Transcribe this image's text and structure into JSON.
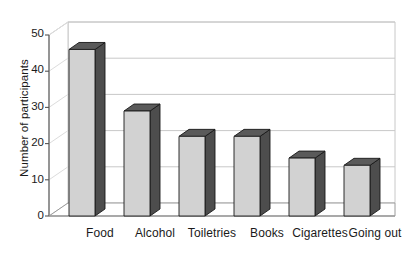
{
  "chart_data": {
    "type": "bar",
    "title": "",
    "title_note": "chart title cropped off at top edge of screenshot, illegible",
    "categories": [
      "Food",
      "Alcohol",
      "Toiletries",
      "Books",
      "Cigarettes",
      "Going out"
    ],
    "values": [
      46,
      29,
      22,
      22,
      16,
      14
    ],
    "xlabel": "",
    "ylabel": "Number of participants",
    "ylim": [
      0,
      50
    ],
    "ytick_labels": [
      "0",
      "10",
      "20",
      "30",
      "40",
      "50"
    ],
    "ytick_values": [
      0,
      10,
      20,
      30,
      40,
      50
    ],
    "grid": true,
    "grid_orientation": "horizontal",
    "legend": "none",
    "style": "3d-column",
    "colors": {
      "bar_front": "#d2d2d2",
      "bar_side": "#4d4d4d",
      "bar_top": "#5a5a5a",
      "bar_outline": "#1a1a1a",
      "gridline": "#c8c8c8",
      "axis": "#555555",
      "wall": "#ffffff",
      "text": "#1a1a1a"
    }
  },
  "axes": {
    "y_title": "Number of participants",
    "ticks": [
      {
        "label": "50",
        "value": 50
      },
      {
        "label": "40",
        "value": 40
      },
      {
        "label": "30",
        "value": 30
      },
      {
        "label": "20",
        "value": 20
      },
      {
        "label": "10",
        "value": 10
      },
      {
        "label": "0",
        "value": 0
      }
    ]
  },
  "bars": [
    {
      "label": "Food",
      "value": 46
    },
    {
      "label": "Alcohol",
      "value": 29
    },
    {
      "label": "Toiletries",
      "value": 22
    },
    {
      "label": "Books",
      "value": 22
    },
    {
      "label": "Cigarettes",
      "value": 16
    },
    {
      "label": "Going out",
      "value": 14
    }
  ]
}
